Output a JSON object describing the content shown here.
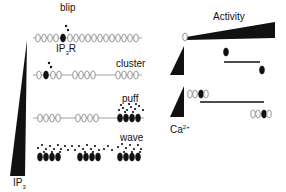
{
  "left_panel": {
    "gradient_label": "IP",
    "gradient_label_sub": "3",
    "rows": [
      {
        "label": "blip",
        "receptor_label": "IP",
        "receptor_label_sub": "3",
        "receptor_label_suffix": "R"
      },
      {
        "label": "cluster"
      },
      {
        "label": "puff"
      },
      {
        "label": "wave"
      }
    ]
  },
  "right_panel": {
    "title": "Activity",
    "calcium_label": "Ca",
    "calcium_label_sup": "2+"
  },
  "colors": {
    "ink": "#111111",
    "receptor_outline": "#8a8a8a",
    "background": "#ffffff"
  }
}
